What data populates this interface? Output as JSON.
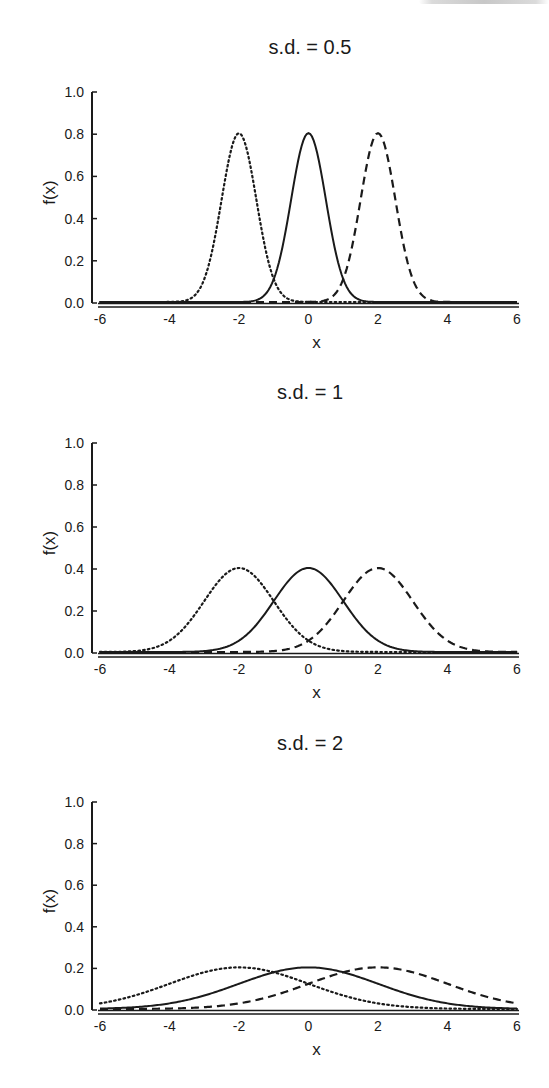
{
  "page": {
    "clipped_header_visible": true
  },
  "chart_data": [
    {
      "type": "line",
      "title": "s.d. = 0.5",
      "xlabel": "x",
      "ylabel": "f(x)",
      "xlim": [
        -6,
        6
      ],
      "ylim": [
        0,
        1.0
      ],
      "xticks": [
        "-6",
        "-4",
        "-2",
        "0",
        "2",
        "4",
        "6"
      ],
      "yticks": [
        "0.0",
        "0.2",
        "0.4",
        "0.6",
        "0.8",
        "1.0"
      ],
      "grid": false,
      "legend": null,
      "sd": 0.5,
      "series": [
        {
          "name": "mean = -2",
          "mean": -2,
          "sd": 0.5,
          "style": "dotted",
          "peak": 0.8
        },
        {
          "name": "mean = 0",
          "mean": 0,
          "sd": 0.5,
          "style": "solid",
          "peak": 0.8
        },
        {
          "name": "mean = 2",
          "mean": 2,
          "sd": 0.5,
          "style": "dashed",
          "peak": 0.8
        }
      ]
    },
    {
      "type": "line",
      "title": "s.d. = 1",
      "xlabel": "x",
      "ylabel": "f(x)",
      "xlim": [
        -6,
        6
      ],
      "ylim": [
        0,
        1.0
      ],
      "xticks": [
        "-6",
        "-4",
        "-2",
        "0",
        "2",
        "4",
        "6"
      ],
      "yticks": [
        "0.0",
        "0.2",
        "0.4",
        "0.6",
        "0.8",
        "1.0"
      ],
      "grid": false,
      "legend": null,
      "sd": 1,
      "series": [
        {
          "name": "mean = -2",
          "mean": -2,
          "sd": 1,
          "style": "dotted",
          "peak": 0.4
        },
        {
          "name": "mean = 0",
          "mean": 0,
          "sd": 1,
          "style": "solid",
          "peak": 0.4
        },
        {
          "name": "mean = 2",
          "mean": 2,
          "sd": 1,
          "style": "dashed",
          "peak": 0.4
        }
      ]
    },
    {
      "type": "line",
      "title": "s.d. = 2",
      "xlabel": "x",
      "ylabel": "f(x)",
      "xlim": [
        -6,
        6
      ],
      "ylim": [
        0,
        1.0
      ],
      "xticks": [
        "-6",
        "-4",
        "-2",
        "0",
        "2",
        "4",
        "6"
      ],
      "yticks": [
        "0.0",
        "0.2",
        "0.4",
        "0.6",
        "0.8",
        "1.0"
      ],
      "grid": false,
      "legend": null,
      "sd": 2,
      "series": [
        {
          "name": "mean = -2",
          "mean": -2,
          "sd": 2,
          "style": "dotted",
          "peak": 0.2
        },
        {
          "name": "mean = 0",
          "mean": 0,
          "sd": 2,
          "style": "solid",
          "peak": 0.2
        },
        {
          "name": "mean = 2",
          "mean": 2,
          "sd": 2,
          "style": "dashed",
          "peak": 0.2
        }
      ]
    }
  ],
  "layout": {
    "panels": [
      {
        "title_top": 36,
        "y_top": 92,
        "y_bottom": 303
      },
      {
        "title_top": 381,
        "y_top": 443,
        "y_bottom": 653
      },
      {
        "title_top": 732,
        "y_top": 802,
        "y_bottom": 1010
      }
    ],
    "x_left_px": 100,
    "x_right_px": 517,
    "y_axis_px": 92,
    "line_color": "#1a1a1a"
  }
}
